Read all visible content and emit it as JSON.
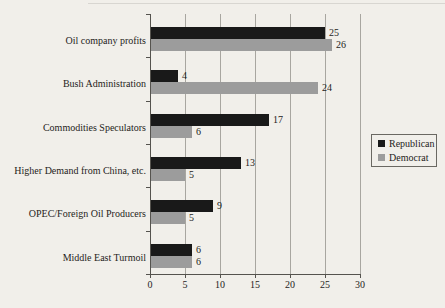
{
  "chart_data": {
    "type": "bar",
    "orientation": "horizontal",
    "title": "",
    "xlabel": "",
    "ylabel": "",
    "categories": [
      "Oil company profits",
      "Bush Administration",
      "Commodities Speculators",
      "Higher Demand from China, etc.",
      "OPEC/Foreign Oil Producers",
      "Middle East Turmoil"
    ],
    "series": [
      {
        "name": "Republican",
        "color": "#191919",
        "values": [
          25,
          4,
          17,
          13,
          9,
          6
        ]
      },
      {
        "name": "Democrat",
        "color": "#9c9c9c",
        "values": [
          26,
          24,
          6,
          5,
          5,
          6
        ]
      }
    ],
    "x_ticks": [
      0,
      5,
      10,
      15,
      20,
      25,
      30
    ],
    "xlim": [
      0,
      30
    ],
    "grid": true,
    "value_labels": true,
    "legend_position": "right"
  },
  "colors": {
    "background": "#f1efea",
    "axis": "#55534e",
    "gridline": "#a8a6a0",
    "text": "#1f1d1b",
    "republican_bar": "#191919",
    "democrat_bar": "#9c9c9c"
  }
}
